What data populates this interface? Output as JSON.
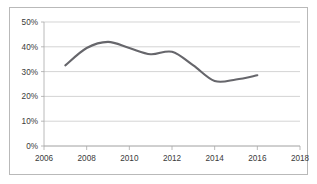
{
  "chart_data": {
    "type": "line",
    "title": "",
    "subtitle": "",
    "xlabel": "",
    "ylabel": "",
    "xlim": [
      2006,
      2018
    ],
    "ylim": [
      0,
      50
    ],
    "grid": true,
    "legend": false,
    "legend_position": "none",
    "y_tick_labels": [
      "50%",
      "40%",
      "30%",
      "20%",
      "10%",
      "0%"
    ],
    "y_tick_values": [
      50,
      40,
      30,
      20,
      10,
      0
    ],
    "x_tick_labels": [
      "2006",
      "2008",
      "2010",
      "2012",
      "2014",
      "2016",
      "2018"
    ],
    "x_tick_values": [
      2006,
      2008,
      2010,
      2012,
      2014,
      2016,
      2018
    ],
    "series": [
      {
        "name": "series-1",
        "color": "#66666b",
        "x": [
          2007,
          2008,
          2009,
          2010,
          2011,
          2012,
          2013,
          2014,
          2015,
          2016
        ],
        "values": [
          32.5,
          39.5,
          42.0,
          39.5,
          37.0,
          38.0,
          32.5,
          26.2,
          26.8,
          28.5
        ]
      }
    ],
    "annotations": []
  },
  "style": {
    "border_color": "#b9b9b9",
    "gridline_color": "#c2c2c2",
    "axis_color": "#a8a8a8",
    "label_color": "#3a3a3a",
    "plot_background": "#ffffff"
  }
}
